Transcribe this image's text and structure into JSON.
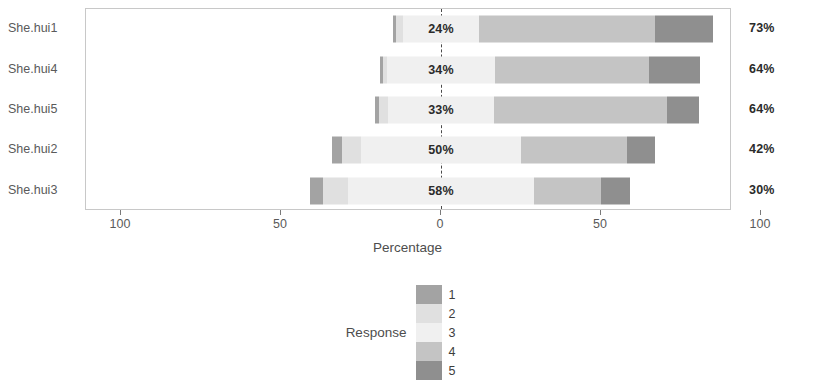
{
  "chart_data": {
    "type": "bar",
    "subtype": "diverging-stacked-likert",
    "title": "",
    "xlabel": "Percentage",
    "ylabel": "",
    "xlim": [
      -100,
      100
    ],
    "xticks": [
      -100,
      -50,
      0,
      50,
      100
    ],
    "xtick_labels": [
      "100",
      "50",
      "0",
      "50",
      "100"
    ],
    "grid": false,
    "legend_position": "bottom",
    "legend_title": "Response",
    "legend_entries": [
      "1",
      "2",
      "3",
      "4",
      "5"
    ],
    "colors": {
      "cat1": "#a3a3a3",
      "cat2": "#e0e0e0",
      "cat3": "#f0f0f0",
      "cat4": "#c4c4c4",
      "cat5": "#8f8f8f",
      "zero_line": "#4a4a4a",
      "panel_border": "#c8c8c8",
      "text": "#4d4d4d"
    },
    "categories": [
      "She.hui1",
      "She.hui4",
      "She.hui5",
      "She.hui2",
      "She.hui3"
    ],
    "series": [
      {
        "name": "1",
        "values": [
          1,
          1,
          1,
          3,
          4
        ]
      },
      {
        "name": "2",
        "values": [
          2,
          1,
          3,
          6,
          8
        ]
      },
      {
        "name": "3",
        "values": [
          24,
          34,
          33,
          50,
          58
        ]
      },
      {
        "name": "4",
        "values": [
          55,
          48,
          54,
          33,
          21
        ]
      },
      {
        "name": "5",
        "values": [
          18,
          16,
          10,
          9,
          9
        ]
      }
    ],
    "rows": [
      {
        "name": "She.hui1",
        "negative_label": "3%",
        "neutral_label": "24%",
        "positive_label": "73%",
        "negative_total": 3,
        "neutral_total": 24,
        "positive_total": 73,
        "segments": [
          1,
          2,
          24,
          55,
          18
        ]
      },
      {
        "name": "She.hui4",
        "negative_label": "2%",
        "neutral_label": "34%",
        "positive_label": "64%",
        "negative_total": 2,
        "neutral_total": 34,
        "positive_total": 64,
        "segments": [
          1,
          1,
          34,
          48,
          16
        ]
      },
      {
        "name": "She.hui5",
        "negative_label": "4%",
        "neutral_label": "33%",
        "positive_label": "64%",
        "negative_total": 4,
        "neutral_total": 33,
        "positive_total": 64,
        "segments": [
          1,
          3,
          33,
          54,
          10
        ]
      },
      {
        "name": "She.hui2",
        "negative_label": "9%",
        "neutral_label": "50%",
        "positive_label": "42%",
        "negative_total": 9,
        "neutral_total": 50,
        "positive_total": 42,
        "segments": [
          3,
          6,
          50,
          33,
          9
        ]
      },
      {
        "name": "She.hui3",
        "negative_label": "12%",
        "neutral_label": "58%",
        "positive_label": "30%",
        "negative_total": 12,
        "neutral_total": 58,
        "positive_total": 30,
        "segments": [
          4,
          8,
          58,
          21,
          9
        ]
      }
    ]
  },
  "axis": {
    "title": "Percentage",
    "ticks": [
      {
        "label": "100",
        "value": -100
      },
      {
        "label": "50",
        "value": -50
      },
      {
        "label": "0",
        "value": 0
      },
      {
        "label": "50",
        "value": 50
      },
      {
        "label": "100",
        "value": 100
      }
    ]
  },
  "legend": {
    "title": "Response",
    "items": [
      {
        "key": "1",
        "color": "#a3a3a3"
      },
      {
        "key": "2",
        "color": "#e0e0e0"
      },
      {
        "key": "3",
        "color": "#f0f0f0"
      },
      {
        "key": "4",
        "color": "#c4c4c4"
      },
      {
        "key": "5",
        "color": "#8f8f8f"
      }
    ]
  }
}
